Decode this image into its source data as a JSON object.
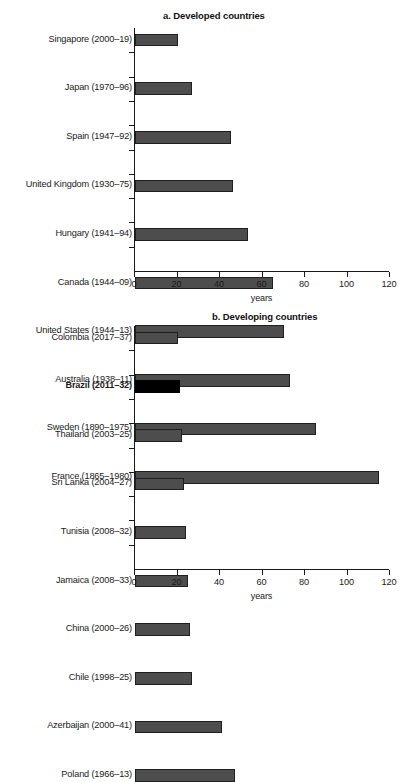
{
  "chart_data": [
    {
      "type": "bar",
      "orientation": "horizontal",
      "title": "a. Developed countries",
      "xlabel": "years",
      "ylabel": "",
      "xlim": [
        0,
        120
      ],
      "xticks": [
        0,
        20,
        40,
        60,
        80,
        100,
        120
      ],
      "grid": false,
      "legend": "none",
      "categories": [
        "Singapore (2000–19)",
        "Japan (1970–96)",
        "Spain (1947–92)",
        "United Kingdom (1930–75)",
        "Hungary (1941–94)",
        "Canada (1944–09)",
        "United States (1944–13)",
        "Australia (1938–11)",
        "Sweden (1890–1975)",
        "France (1865–1980)"
      ],
      "values": [
        20,
        27,
        45,
        46,
        53,
        65,
        70,
        73,
        85,
        115
      ],
      "bar_colors": [
        "#4d4d4d",
        "#4d4d4d",
        "#4d4d4d",
        "#4d4d4d",
        "#4d4d4d",
        "#4d4d4d",
        "#4d4d4d",
        "#4d4d4d",
        "#4d4d4d",
        "#4d4d4d"
      ],
      "highlight_index": -1
    },
    {
      "type": "bar",
      "orientation": "horizontal",
      "title": "b. Developing countries",
      "xlabel": "years",
      "ylabel": "",
      "xlim": [
        0,
        120
      ],
      "xticks": [
        0,
        20,
        40,
        60,
        80,
        100,
        120
      ],
      "grid": false,
      "legend": "none",
      "categories": [
        "Colombia (2017–37)",
        "Brazil (2011–32)",
        "Thailand (2003–25)",
        "Sri Lanka (2004–27)",
        "Tunisia (2008–32)",
        "Jamaica (2008–33)",
        "China (2000–26)",
        "Chile (1998–25)",
        "Azerbaijan (2000–41)",
        "Poland (1966–13)"
      ],
      "values": [
        20,
        21,
        22,
        23,
        24,
        25,
        26,
        27,
        41,
        47
      ],
      "bar_colors": [
        "#4d4d4d",
        "#000000",
        "#4d4d4d",
        "#4d4d4d",
        "#4d4d4d",
        "#4d4d4d",
        "#4d4d4d",
        "#4d4d4d",
        "#4d4d4d",
        "#4d4d4d"
      ],
      "highlight_index": 1
    }
  ],
  "colors": {
    "bar_fill": "#4d4d4d",
    "bar_edge": "#1f1f1f",
    "bar_highlight": "#000000",
    "axis": "#1a1a1a",
    "background": "#ffffff",
    "text": "#1a1a1a"
  }
}
